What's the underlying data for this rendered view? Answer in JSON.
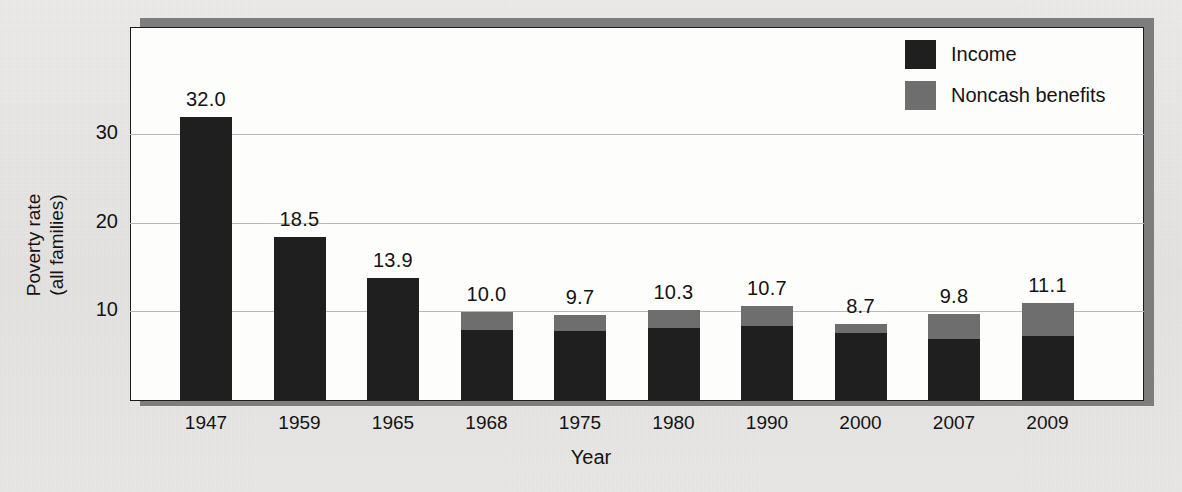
{
  "figure": {
    "xlabel": "Year",
    "ylabel_line1": "Poverty rate",
    "ylabel_line2": "(all families)"
  },
  "legend": {
    "items": [
      {
        "label": "Income",
        "color": "#201f1f",
        "swatch_name": "income-swatch"
      },
      {
        "label": "Noncash benefits",
        "color": "#6e6e6e",
        "swatch_name": "noncash-swatch"
      }
    ]
  },
  "ghost_text": {
    "top": "",
    "mid": "",
    "bottom": ""
  },
  "chart_data": {
    "type": "bar",
    "stacked": true,
    "title": "",
    "xlabel": "Year",
    "ylabel": "Poverty rate (all families)",
    "ylim": [
      0,
      35
    ],
    "yticks": [
      "10",
      "20",
      "30"
    ],
    "ytick_values": [
      10,
      20,
      30
    ],
    "grid": "horizontal",
    "legend_position": "top-right",
    "categories": [
      "1947",
      "1959",
      "1965",
      "1968",
      "1975",
      "1980",
      "1990",
      "2000",
      "2007",
      "2009"
    ],
    "totals": [
      32.0,
      18.5,
      13.9,
      10.0,
      9.7,
      10.3,
      10.7,
      8.7,
      9.8,
      11.1
    ],
    "data_labels": [
      "32.0",
      "18.5",
      "13.9",
      "10.0",
      "9.7",
      "10.3",
      "10.7",
      "8.7",
      "9.8",
      "11.1"
    ],
    "series": [
      {
        "name": "Income",
        "color": "#201f1f",
        "values": [
          32.0,
          18.5,
          13.9,
          8.0,
          7.9,
          8.2,
          8.5,
          7.7,
          7.0,
          7.3
        ]
      },
      {
        "name": "Noncash benefits",
        "color": "#6e6e6e",
        "values": [
          0.0,
          0.0,
          0.0,
          2.0,
          1.8,
          2.1,
          2.2,
          1.0,
          2.8,
          3.8
        ]
      }
    ]
  }
}
